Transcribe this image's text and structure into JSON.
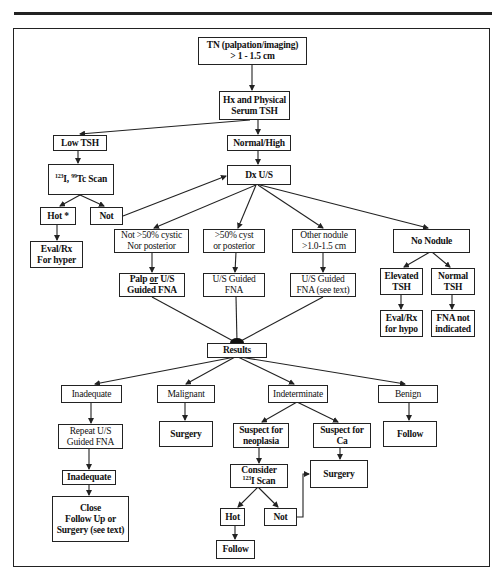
{
  "flowchart": {
    "nodes": {
      "tn": {
        "lines": [
          "TN (palpation/imaging)",
          "> 1 - 1.5 cm"
        ]
      },
      "hx": {
        "lines": [
          "Hx and Physical",
          "Serum TSH"
        ]
      },
      "low_tsh": {
        "lines": [
          "Low TSH"
        ]
      },
      "normal_high": {
        "lines": [
          "Normal/High"
        ]
      },
      "scan": {
        "sup1": "123",
        "mid": "I, ",
        "sup2": "99",
        "rest": "Tc Scan"
      },
      "dx_us": {
        "lines": [
          "Dx U/S"
        ]
      },
      "hot_top": {
        "lines": [
          "Hot *"
        ]
      },
      "not_top": {
        "lines": [
          "Not"
        ]
      },
      "eval_hyper": {
        "lines": [
          "Eval/Rx",
          "For hyper"
        ]
      },
      "not_cystic": {
        "lines": [
          "Not >50% cystic",
          "Nor posterior"
        ]
      },
      "cystic": {
        "lines": [
          ">50% cyst",
          "or posterior"
        ]
      },
      "other_nodule": {
        "lines": [
          "Other nodule",
          ">1.0-1.5 cm"
        ]
      },
      "no_nodule": {
        "lines": [
          "No Nodule"
        ]
      },
      "palp_fna": {
        "l1a": "Palp ",
        "l1b": "or",
        "l1c": " U/S",
        "l2": "Guided FNA"
      },
      "us_fna": {
        "lines": [
          "U/S Guided",
          "FNA"
        ]
      },
      "us_fna_text": {
        "lines": [
          "U/S Guided",
          "FNA (see text)"
        ]
      },
      "elevated_tsh": {
        "lines": [
          "Elevated",
          "TSH"
        ]
      },
      "normal_tsh": {
        "lines": [
          "Normal",
          "TSH"
        ]
      },
      "eval_hypo": {
        "lines": [
          "Eval/Rx",
          "for hypo"
        ]
      },
      "fna_not": {
        "lines": [
          "FNA not",
          "indicated"
        ]
      },
      "results": {
        "lines": [
          "Results"
        ]
      },
      "inadequate": {
        "lines": [
          "Inadequate"
        ]
      },
      "malignant": {
        "lines": [
          "Malignant"
        ]
      },
      "indeterminate": {
        "lines": [
          "Indeterminate"
        ]
      },
      "benign": {
        "lines": [
          "Benign"
        ]
      },
      "repeat_fna": {
        "lines": [
          "Repeat U/S",
          "Guided  FNA"
        ]
      },
      "surgery_malig": {
        "lines": [
          "Surgery"
        ]
      },
      "suspect_neo": {
        "lines": [
          "Suspect for",
          "neoplasia"
        ]
      },
      "suspect_ca": {
        "lines": [
          "Suspect for",
          "Ca"
        ]
      },
      "follow_benign": {
        "lines": [
          "Follow"
        ]
      },
      "inadequate2": {
        "lines": [
          "Inadequate"
        ]
      },
      "consider_scan": {
        "l1": "Consider",
        "sup": "123",
        "l2": "I Scan"
      },
      "surgery_ca": {
        "lines": [
          "Surgery"
        ]
      },
      "close_follow": {
        "lines": [
          "Close",
          "Follow Up or",
          "Surgery (see text)"
        ]
      },
      "hot_bottom": {
        "lines": [
          "Hot"
        ]
      },
      "not_bottom": {
        "lines": [
          "Not"
        ]
      },
      "follow_bottom": {
        "lines": [
          "Follow"
        ]
      }
    }
  },
  "colors": {
    "line": "#222222",
    "background": "#ffffff"
  }
}
